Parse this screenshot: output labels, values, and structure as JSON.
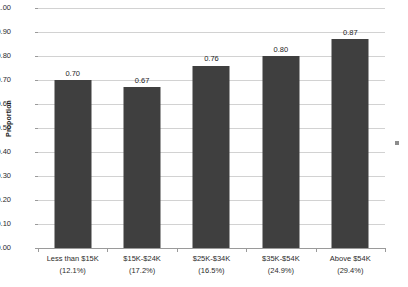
{
  "chart_data": {
    "type": "bar",
    "title": "",
    "subtitle": "",
    "xlabel": "",
    "ylabel": "Proportion",
    "ylim": [
      0.0,
      1.0
    ],
    "ytick_step": 0.1,
    "grid": true,
    "legend": null,
    "categories": [
      "Less than $15K",
      "$15K-$24K",
      "$25K-$34K",
      "$35K-$54K",
      "Above $54K"
    ],
    "category_percentages": [
      "(12.1%)",
      "(17.2%)",
      "(16.5%)",
      "(24.9%)",
      "(29.4%)"
    ],
    "values": [
      0.7,
      0.67,
      0.76,
      0.8,
      0.87
    ],
    "value_labels": [
      "0.70",
      "0.67",
      "0.76",
      "0.80",
      "0.87"
    ],
    "ytick_labels": [
      "1.00",
      "0.90",
      "0.80",
      "0.70",
      "0.60",
      "0.50",
      "0.40",
      "0.30",
      "0.20",
      "0.10",
      "0.00"
    ],
    "ytick_values": [
      1.0,
      0.9,
      0.8,
      0.7,
      0.6,
      0.5,
      0.4,
      0.3,
      0.2,
      0.1,
      0.0
    ],
    "colors": {
      "bar": "#3f3f3f",
      "gridline": "#d2d2d2",
      "axis": "#9a9a9a",
      "text": "#2b2b2b",
      "background": "#ffffff"
    }
  },
  "artifact": {
    "name": "stray-mark"
  }
}
